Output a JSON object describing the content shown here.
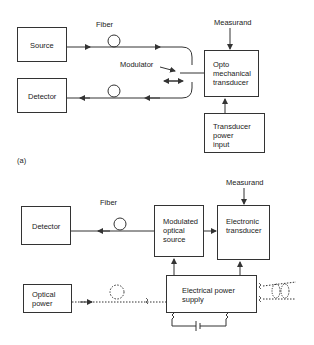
{
  "diagram_a": {
    "label": "(a)",
    "source": "Source",
    "detector": "Detector",
    "fiber_label": "Fiber",
    "modulator_label": "Modulator",
    "measurand_label": "Measurand",
    "opto_transducer": [
      "Opto",
      "mechanical",
      "transducer"
    ],
    "transducer_power": [
      "Transducer",
      "power",
      "input"
    ]
  },
  "diagram_b": {
    "detector": "Detector",
    "fiber_label": "Fiber",
    "measurand_label": "Measurand",
    "modulated_source": [
      "Modulated",
      "optical",
      "source"
    ],
    "electronic_transducer": [
      "Electronic",
      "transducer"
    ],
    "electrical_power_supply": [
      "Electrical power",
      "supply"
    ],
    "optical_power": [
      "Optical",
      "power"
    ]
  },
  "colors": {
    "line": "#333333",
    "background": "#ffffff"
  }
}
